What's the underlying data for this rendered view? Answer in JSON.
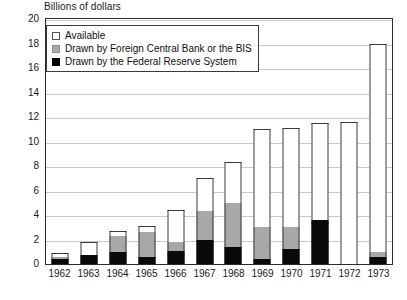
{
  "chart_data": {
    "type": "bar",
    "title": "Billions of dollars",
    "xlabel": "",
    "ylabel": "Billions of dollars",
    "ylim": [
      0,
      20
    ],
    "ytick_step": 2,
    "grid": true,
    "stacked": true,
    "legend_position": "top-left-inside",
    "categories": [
      "1962",
      "1963",
      "1964",
      "1965",
      "1966",
      "1967",
      "1968",
      "1969",
      "1970",
      "1971",
      "1972",
      "1973"
    ],
    "series": [
      {
        "name": "Drawn by the Federal Reserve System",
        "color": "#000000",
        "values": [
          0.4,
          0.7,
          1.0,
          0.6,
          1.1,
          2.0,
          1.4,
          0.45,
          1.2,
          3.6,
          0.0,
          0.6
        ]
      },
      {
        "name": "Drawn by Foreign Central Bank or the BIS",
        "color": "#a8a8a8",
        "values": [
          0.2,
          0.0,
          1.3,
          2.0,
          0.7,
          2.3,
          3.6,
          2.55,
          1.8,
          0.0,
          0.0,
          0.4
        ]
      },
      {
        "name": "Available",
        "color": "#ffffff",
        "values": [
          0.3,
          1.1,
          0.4,
          0.5,
          2.6,
          2.7,
          3.3,
          8.0,
          8.1,
          7.9,
          11.6,
          17.0
        ]
      }
    ],
    "totals": [
      0.9,
      1.8,
      2.7,
      3.1,
      4.4,
      7.0,
      8.3,
      11.0,
      11.1,
      11.5,
      11.6,
      18.0
    ],
    "ytick_labels": [
      "20",
      "18",
      "16",
      "14",
      "12",
      "10",
      "8",
      "6",
      "4",
      "2",
      "0"
    ]
  },
  "legend": {
    "items": [
      {
        "label": "Available",
        "swatch": "available-swatch"
      },
      {
        "label": "Drawn by Foreign Central Bank or the BIS",
        "swatch": "bis-swatch"
      },
      {
        "label": "Drawn by the Federal Reserve System",
        "swatch": "fed-swatch"
      }
    ]
  },
  "caption": {
    "text": ""
  }
}
